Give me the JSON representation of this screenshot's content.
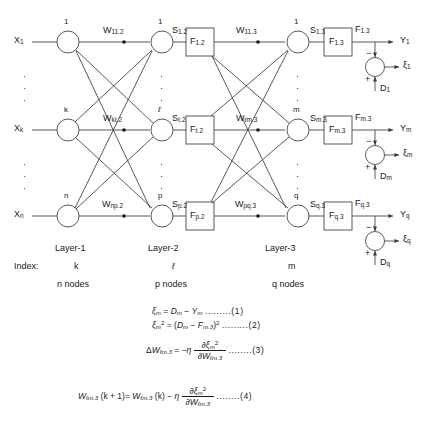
{
  "diagram": {
    "stroke_color": "#3c3c3c",
    "text_color": "#1a1a1a"
  },
  "inputs": [
    {
      "label": "X",
      "sub": "1"
    },
    {
      "label": "X",
      "sub": "k"
    },
    {
      "label": "X",
      "sub": "n"
    }
  ],
  "layer1_nodes": [
    "1",
    "k",
    "n"
  ],
  "layer2_nodes": [
    "1",
    "ℓ",
    "p"
  ],
  "layer3_nodes": [
    "1",
    "m",
    "q"
  ],
  "weights_12": [
    {
      "base": "W",
      "sub": "11.2"
    },
    {
      "base": "W",
      "sub": "kℓ.2"
    },
    {
      "base": "W",
      "sub": "np.2"
    }
  ],
  "weights_23": [
    {
      "base": "W",
      "sub": "11.3"
    },
    {
      "base": "W",
      "sub": "ℓm.3"
    },
    {
      "base": "W",
      "sub": "pq.3"
    }
  ],
  "sums_2": [
    {
      "base": "S",
      "sub": "1.2"
    },
    {
      "base": "S",
      "sub": "ℓ.2"
    },
    {
      "base": "S",
      "sub": "p.2"
    }
  ],
  "sums_3": [
    {
      "base": "S",
      "sub": "1.3"
    },
    {
      "base": "S",
      "sub": "m.3"
    },
    {
      "base": "S",
      "sub": "q.3"
    }
  ],
  "blocks_2": [
    {
      "base": "F",
      "sub": "1.2"
    },
    {
      "base": "F",
      "sub": "ℓ.2"
    },
    {
      "base": "F",
      "sub": "p.2"
    }
  ],
  "blocks_3": [
    {
      "base": "F",
      "sub": "1.3"
    },
    {
      "base": "F",
      "sub": "m.3"
    },
    {
      "base": "F",
      "sub": "q.3"
    }
  ],
  "block3_outputs": [
    {
      "base": "F",
      "sub": "1.3"
    },
    {
      "base": "F",
      "sub": "m.3"
    },
    {
      "base": "F",
      "sub": "q.3"
    }
  ],
  "outputs": [
    {
      "base": "Y",
      "sub": "1"
    },
    {
      "base": "Y",
      "sub": "m"
    },
    {
      "base": "Y",
      "sub": "q"
    }
  ],
  "errors": [
    {
      "base": "ξ",
      "sub": "1"
    },
    {
      "base": "ξ",
      "sub": "m"
    },
    {
      "base": "ξ",
      "sub": "q"
    }
  ],
  "desired": [
    {
      "base": "D",
      "sub": "1"
    },
    {
      "base": "D",
      "sub": "m"
    },
    {
      "base": "D",
      "sub": "q"
    }
  ],
  "junction_signs": {
    "top": "−",
    "bottom": "+"
  },
  "vertical_dots": "·",
  "legend": {
    "index_caption": "Index:",
    "columns": [
      {
        "layer": "Layer-1",
        "index": "k",
        "nodes": "n nodes"
      },
      {
        "layer": "Layer-2",
        "index": "ℓ",
        "nodes": "p nodes"
      },
      {
        "layer": "Layer-3",
        "index": "m",
        "nodes": "q nodes"
      }
    ]
  },
  "equations": [
    {
      "id": "1",
      "text": "ξ_m = D_m − Y_m",
      "number": ".........(1)",
      "parts": {
        "lhs_base": "ξ",
        "lhs_sub": "m",
        "eq": "=",
        "d_base": "D",
        "d_sub": "m",
        "minus": "−",
        "y_base": "Y",
        "y_sub": "m"
      }
    },
    {
      "id": "2",
      "text": "ξ_m² = (D_m − F_m.3)²",
      "number": ".........(2)",
      "parts": {
        "lhs_base": "ξ",
        "lhs_sub": "m",
        "lhs_sup": "2",
        "eq": "=",
        "open": "(",
        "d_base": "D",
        "d_sub": "m",
        "minus": "−",
        "f_base": "F",
        "f_sub": "m.3",
        "close": ")",
        "sup": "2"
      }
    },
    {
      "id": "3",
      "text": "ΔW_ℓm.3 = −η ∂ξ_m² / ∂W_ℓm.3",
      "number": "........(3)",
      "parts": {
        "delta": "Δ",
        "w_base": "W",
        "w_sub": "ℓm.3",
        "eq": "=",
        "neg_eta": "−η",
        "num_d": "∂",
        "num_xi": "ξ",
        "num_sub": "m",
        "num_sup": "2",
        "den_d": "∂",
        "den_w": "W",
        "den_sub": "ℓm.3"
      }
    },
    {
      "id": "4",
      "text": "W_ℓm.3 (k + 1) = W_ℓm.3 (k) − η ∂ξ_m² / ∂W_ℓm.3",
      "number": "........(4)",
      "parts": {
        "w_base": "W",
        "w_sub": "ℓm.3",
        "kp1": "(k + 1)",
        "eq": "=",
        "w2_base": "W",
        "w2_sub": "ℓm.3",
        "k": "(k)",
        "minus": "−",
        "eta": "η",
        "num_d": "∂",
        "num_xi": "ξ",
        "num_sub": "m",
        "num_sup": "2",
        "den_d": "∂",
        "den_w": "W",
        "den_sub": "ℓm.3"
      }
    }
  ]
}
